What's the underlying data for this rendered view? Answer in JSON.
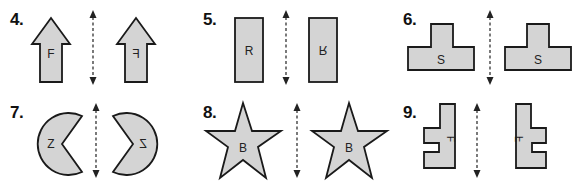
{
  "problems": [
    {
      "number": "4.",
      "shape": "arrow-up",
      "letter": "F",
      "reflected_letter": "F"
    },
    {
      "number": "5.",
      "shape": "rectangle",
      "letter": "R",
      "reflected_letter": "R"
    },
    {
      "number": "6.",
      "shape": "t-shape",
      "letter": "S",
      "reflected_letter": "S"
    },
    {
      "number": "7.",
      "shape": "pac-man",
      "letter": "Z",
      "reflected_letter": "Z"
    },
    {
      "number": "8.",
      "shape": "star",
      "letter": "B",
      "reflected_letter": "B"
    },
    {
      "number": "9.",
      "shape": "l-shape-notched",
      "letter": "F",
      "reflected_letter": "F"
    }
  ],
  "colors": {
    "fill": "#d4d4d4",
    "stroke": "#1a1a1a"
  }
}
